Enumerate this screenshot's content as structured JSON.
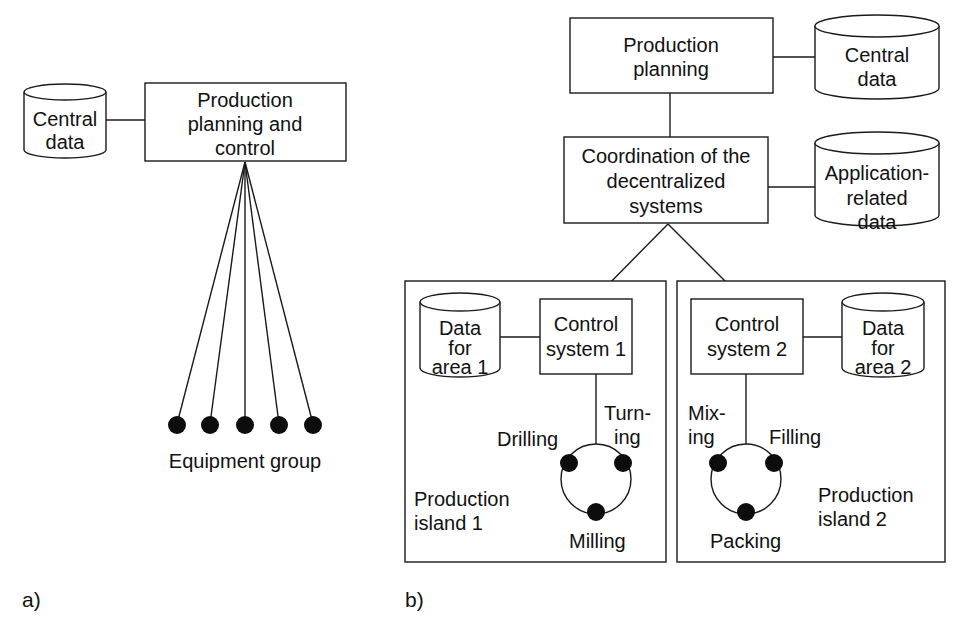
{
  "colors": {
    "ink": "#111111",
    "background": "#ffffff"
  },
  "panel_a": {
    "label": "a)",
    "central_data": [
      "Central",
      "data"
    ],
    "ppc_box": [
      "Production",
      "planning and",
      "control"
    ],
    "equipment_group_label": "Equipment group",
    "equipment_count": 5
  },
  "panel_b": {
    "label": "b)",
    "production_planning": [
      "Production",
      "planning"
    ],
    "central_data": [
      "Central",
      "data"
    ],
    "coordination": [
      "Coordination of the",
      "decentralized",
      "systems"
    ],
    "application_data": [
      "Application-",
      "related",
      "data"
    ],
    "island1": {
      "title": [
        "Production",
        "island 1"
      ],
      "control": [
        "Control",
        "system 1"
      ],
      "data": [
        "Data",
        "for",
        "area 1"
      ],
      "stations": {
        "left": "Drilling",
        "right": [
          "Turn-",
          "ing"
        ],
        "bottom": "Milling"
      }
    },
    "island2": {
      "title": [
        "Production",
        "island 2"
      ],
      "control": [
        "Control",
        "system 2"
      ],
      "data": [
        "Data",
        "for",
        "area 2"
      ],
      "stations": {
        "left": [
          "Mix-",
          "ing"
        ],
        "right": "Filling",
        "bottom": "Packing"
      }
    }
  }
}
